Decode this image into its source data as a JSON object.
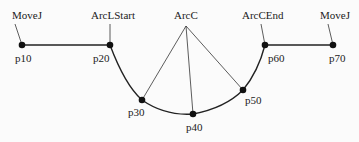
{
  "diagram": {
    "instructions": [
      {
        "id": "movej1",
        "label": "MoveJ",
        "x": 14,
        "y": 19
      },
      {
        "id": "arclstart",
        "label": "ArcLStart",
        "x": 110,
        "y": 19
      },
      {
        "id": "arcc",
        "label": "ArcC",
        "x": 186,
        "y": 19
      },
      {
        "id": "arccend",
        "label": "ArcCEnd",
        "x": 262,
        "y": 19
      },
      {
        "id": "movej2",
        "label": "MoveJ",
        "x": 333,
        "y": 19
      }
    ],
    "points": [
      {
        "id": "p10",
        "label": "p10",
        "x": 22,
        "y": 45
      },
      {
        "id": "p20",
        "label": "p20",
        "x": 110,
        "y": 45
      },
      {
        "id": "p30",
        "label": "p30",
        "x": 142,
        "y": 100
      },
      {
        "id": "p40",
        "label": "p40",
        "x": 193,
        "y": 114
      },
      {
        "id": "p50",
        "label": "p50",
        "x": 243,
        "y": 90
      },
      {
        "id": "p60",
        "label": "p60",
        "x": 265,
        "y": 45
      },
      {
        "id": "p70",
        "label": "p70",
        "x": 333,
        "y": 45
      }
    ],
    "colors": {
      "line": "#222222",
      "point": "#111111",
      "background": "#fbfbfb"
    }
  }
}
